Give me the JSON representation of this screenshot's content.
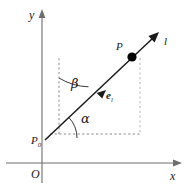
{
  "figure": {
    "kind": "geometry-diagram",
    "background_color": "#ffffff",
    "width": 193,
    "height": 191
  },
  "axes": {
    "y_label": "y",
    "x_label": "x",
    "origin_label": "O",
    "axis_color": "#6e6e6e",
    "y_axis": {
      "x": 42,
      "y_top": 12,
      "y_bottom": 183
    },
    "x_axis": {
      "y": 163,
      "x_left": 6,
      "x_right": 181
    }
  },
  "line": {
    "name_label": "l",
    "color": "#1a1a1a",
    "start": {
      "x": 47,
      "y": 138
    },
    "end": {
      "x": 159,
      "y": 32
    }
  },
  "points": [
    {
      "id": "p0",
      "label": "P",
      "subscript": "0",
      "x": 47,
      "y": 138,
      "marked": false
    },
    {
      "id": "p",
      "label": "P",
      "subscript": "",
      "x": 132,
      "y": 57,
      "marked": true,
      "dot_color": "#000000"
    }
  ],
  "vector": {
    "label": "e",
    "subscript": "l",
    "x": 100,
    "y": 96,
    "description": "unit direction vector along line l"
  },
  "angles": [
    {
      "id": "alpha",
      "symbol": "α",
      "between": "positive x direction and line l",
      "label_x": 84,
      "label_y": 119
    },
    {
      "id": "beta",
      "symbol": "β",
      "between": "positive y direction and line l",
      "label_x": 75,
      "label_y": 84
    }
  ],
  "guides": [
    {
      "id": "vertical-from-p0",
      "style": "dashed",
      "color": "#8a8a8a"
    },
    {
      "id": "horizontal-from-p0",
      "style": "dashed",
      "color": "#8a8a8a"
    },
    {
      "id": "vertical-right",
      "style": "dashed",
      "color": "#b4b4b4"
    }
  ]
}
